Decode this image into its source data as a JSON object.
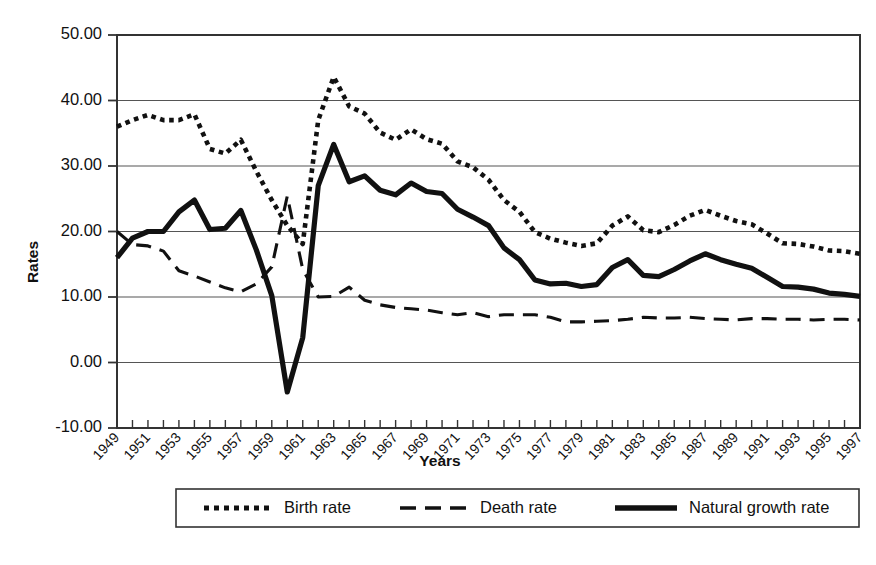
{
  "chart_data": {
    "type": "line",
    "title": "",
    "xlabel": "Years",
    "ylabel": "Rates",
    "ylim": [
      -10,
      50
    ],
    "xlim": [
      1949,
      1997
    ],
    "grid": true,
    "legend_position": "bottom",
    "y_ticks": [
      "-10.00",
      "0.00",
      "10.00",
      "20.00",
      "30.00",
      "40.00",
      "50.00"
    ],
    "y_tick_values": [
      -10,
      0,
      10,
      20,
      30,
      40,
      50
    ],
    "x": [
      1949,
      1950,
      1951,
      1952,
      1953,
      1954,
      1955,
      1956,
      1957,
      1958,
      1959,
      1960,
      1961,
      1962,
      1963,
      1964,
      1965,
      1966,
      1967,
      1968,
      1969,
      1970,
      1971,
      1972,
      1973,
      1974,
      1975,
      1976,
      1977,
      1978,
      1979,
      1980,
      1981,
      1982,
      1983,
      1984,
      1985,
      1986,
      1987,
      1988,
      1989,
      1990,
      1991,
      1992,
      1993,
      1994,
      1995,
      1996,
      1997
    ],
    "x_tick_labels": [
      "1949",
      "1951",
      "1953",
      "1955",
      "1957",
      "1959",
      "1961",
      "1963",
      "1965",
      "1967",
      "1969",
      "1971",
      "1973",
      "1975",
      "1977",
      "1979",
      "1981",
      "1983",
      "1985",
      "1987",
      "1989",
      "1991",
      "1993",
      "1995",
      "1997"
    ],
    "series": [
      {
        "name": "Birth rate",
        "style": "dotted",
        "values": [
          36.0,
          37.0,
          37.8,
          37.0,
          37.0,
          37.9,
          32.6,
          31.9,
          34.0,
          29.2,
          24.8,
          20.9,
          18.1,
          37.0,
          43.6,
          39.1,
          38.0,
          35.1,
          34.0,
          35.6,
          34.1,
          33.4,
          30.7,
          29.8,
          27.9,
          24.8,
          23.0,
          19.9,
          18.9,
          18.3,
          17.8,
          18.2,
          20.9,
          22.3,
          20.2,
          19.9,
          21.0,
          22.4,
          23.3,
          22.4,
          21.6,
          21.1,
          19.7,
          18.2,
          18.1,
          17.7,
          17.1,
          17.0,
          16.6
        ],
        "color": "#111111"
      },
      {
        "name": "Death rate",
        "style": "dashed",
        "values": [
          20.0,
          18.0,
          17.8,
          17.0,
          14.0,
          13.2,
          12.3,
          11.4,
          10.8,
          12.0,
          14.6,
          25.4,
          14.2,
          10.0,
          10.1,
          11.5,
          9.5,
          8.8,
          8.4,
          8.2,
          8.0,
          7.6,
          7.3,
          7.6,
          7.0,
          7.3,
          7.3,
          7.3,
          6.9,
          6.2,
          6.2,
          6.3,
          6.4,
          6.6,
          6.9,
          6.8,
          6.8,
          6.9,
          6.7,
          6.6,
          6.5,
          6.7,
          6.7,
          6.6,
          6.6,
          6.5,
          6.6,
          6.6,
          6.5
        ],
        "color": "#111111"
      },
      {
        "name": "Natural growth rate",
        "style": "solid",
        "values": [
          16.0,
          19.0,
          20.0,
          20.0,
          23.0,
          24.8,
          20.3,
          20.5,
          23.2,
          17.2,
          10.2,
          -4.5,
          3.8,
          27.0,
          33.3,
          27.6,
          28.5,
          26.3,
          25.6,
          27.4,
          26.1,
          25.8,
          23.4,
          22.2,
          20.9,
          17.5,
          15.7,
          12.6,
          12.0,
          12.1,
          11.6,
          11.9,
          14.5,
          15.7,
          13.3,
          13.1,
          14.2,
          15.5,
          16.6,
          15.7,
          15.0,
          14.4,
          13.0,
          11.6,
          11.5,
          11.2,
          10.6,
          10.4,
          10.1
        ],
        "color": "#111111"
      }
    ]
  },
  "axis": {
    "y_title": "Rates",
    "x_title": "Years"
  },
  "legend": {
    "items": [
      {
        "label": "Birth rate",
        "style": "dotted"
      },
      {
        "label": "Death rate",
        "style": "dashed"
      },
      {
        "label": "Natural growth rate",
        "style": "solid"
      }
    ]
  }
}
